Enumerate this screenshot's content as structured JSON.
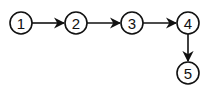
{
  "diagram": {
    "type": "flow",
    "nodes": [
      {
        "id": "1",
        "label": "1",
        "x": 21,
        "y": 23
      },
      {
        "id": "2",
        "label": "2",
        "x": 76,
        "y": 23
      },
      {
        "id": "3",
        "label": "3",
        "x": 132,
        "y": 23
      },
      {
        "id": "4",
        "label": "4",
        "x": 188,
        "y": 23
      },
      {
        "id": "5",
        "label": "5",
        "x": 188,
        "y": 73
      }
    ],
    "edges": [
      {
        "from": "1",
        "to": "2"
      },
      {
        "from": "2",
        "to": "3"
      },
      {
        "from": "3",
        "to": "4"
      },
      {
        "from": "4",
        "to": "5"
      }
    ],
    "colors": {
      "stroke": "#111111",
      "fill": "#ffffff"
    }
  }
}
